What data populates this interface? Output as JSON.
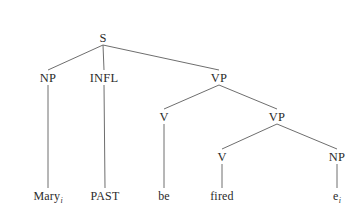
{
  "figure": {
    "kind": "syntax-tree",
    "background_color": "#ffffff",
    "edge_color": "#6e6e6e",
    "text_color": "#2b2b2b",
    "sentence": "Mary PAST be fired",
    "width": 358,
    "height": 216
  },
  "nodes": [
    {
      "id": "s",
      "label": "S",
      "type": "nonterminal",
      "x": 103,
      "y": 38
    },
    {
      "id": "np1",
      "label": "NP",
      "type": "nonterminal",
      "x": 48,
      "y": 78
    },
    {
      "id": "infl",
      "label": "INFL",
      "type": "nonterminal",
      "x": 104,
      "y": 78
    },
    {
      "id": "vp1",
      "label": "VP",
      "type": "nonterminal",
      "x": 219,
      "y": 78
    },
    {
      "id": "v1",
      "label": "V",
      "type": "nonterminal",
      "x": 164,
      "y": 117
    },
    {
      "id": "vp2",
      "label": "VP",
      "type": "nonterminal",
      "x": 277,
      "y": 117
    },
    {
      "id": "v2",
      "label": "V",
      "type": "nonterminal",
      "x": 222,
      "y": 157
    },
    {
      "id": "np2",
      "label": "NP",
      "type": "nonterminal",
      "x": 337,
      "y": 157
    },
    {
      "id": "mary",
      "label": "Mary",
      "type": "terminal",
      "subscript": "i",
      "x": 48,
      "y": 196
    },
    {
      "id": "past",
      "label": "PAST",
      "type": "terminal",
      "subscript": "",
      "x": 105,
      "y": 196
    },
    {
      "id": "be",
      "label": "be",
      "type": "terminal",
      "subscript": "",
      "x": 164,
      "y": 196
    },
    {
      "id": "fired",
      "label": "fired",
      "type": "terminal",
      "subscript": "",
      "x": 222,
      "y": 196
    },
    {
      "id": "trace",
      "label": "e",
      "type": "terminal",
      "subscript": "i",
      "x": 337,
      "y": 196
    }
  ],
  "edges": [
    {
      "from": "s",
      "to": "np1"
    },
    {
      "from": "s",
      "to": "infl"
    },
    {
      "from": "s",
      "to": "vp1"
    },
    {
      "from": "np1",
      "to": "mary"
    },
    {
      "from": "infl",
      "to": "past"
    },
    {
      "from": "vp1",
      "to": "v1"
    },
    {
      "from": "vp1",
      "to": "vp2"
    },
    {
      "from": "v1",
      "to": "be"
    },
    {
      "from": "vp2",
      "to": "v2"
    },
    {
      "from": "vp2",
      "to": "np2"
    },
    {
      "from": "v2",
      "to": "fired"
    },
    {
      "from": "np2",
      "to": "trace"
    }
  ]
}
